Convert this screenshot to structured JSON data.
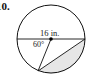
{
  "problem": {
    "number": "10."
  },
  "diagram": {
    "type": "circle-geometry",
    "diameter_label": "16 in.",
    "angle_label": "60°",
    "colors": {
      "stroke": "#111111",
      "shade": "#e6e6e6",
      "background": "#ffffff"
    },
    "circle": {
      "cx": 51,
      "cy": 39,
      "r": 34
    },
    "shaded_region": "circular segment between chord and arc (lower right)"
  }
}
